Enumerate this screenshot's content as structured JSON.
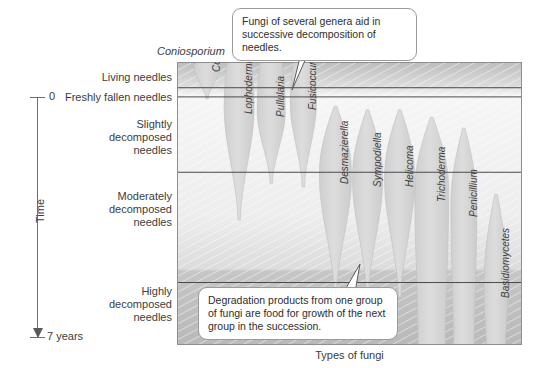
{
  "figure": {
    "x_axis_title": "Types of fungi",
    "time_axis": {
      "label": "Time",
      "start_label": "0",
      "end_label": "7 years"
    },
    "top_specimen_label": "Coniosporium"
  },
  "stages": [
    {
      "id": "living",
      "label": "Living needles"
    },
    {
      "id": "freshly-fallen",
      "label": "Freshly fallen needles"
    },
    {
      "id": "slightly",
      "label": "Slightly\ndecomposed\nneedles"
    },
    {
      "id": "moderately",
      "label": "Moderately\ndecomposed\nneedles"
    },
    {
      "id": "highly",
      "label": "Highly\ndecomposed\nneedles"
    }
  ],
  "callouts": [
    {
      "id": "top",
      "text": "Fungi of several genera aid in successive decomposition of needles."
    },
    {
      "id": "bottom",
      "text": "Degradation products from one group of fungi are food for growth of the next group in the succession."
    }
  ],
  "chart_data": {
    "type": "area",
    "xlabel": "Types of fungi",
    "ylabel": "Time",
    "ylim": [
      0,
      7
    ],
    "ylim_units": "years",
    "grid": false,
    "legend": "none",
    "y_zones": [
      {
        "name": "Living needles",
        "top_years": -0.7,
        "bottom_years": 0.0
      },
      {
        "name": "Freshly fallen needles",
        "top_years": 0.0,
        "bottom_years": 0.25
      },
      {
        "name": "Slightly decomposed needles",
        "top_years": 0.25,
        "bottom_years": 2.3
      },
      {
        "name": "Moderately decomposed needles",
        "top_years": 2.3,
        "bottom_years": 5.3
      },
      {
        "name": "Highly decomposed needles",
        "top_years": 5.3,
        "bottom_years": 7.0
      }
    ],
    "categories": [
      "Coniosporium",
      "Lophodermium",
      "Pullularia",
      "Fusicoccum",
      "Desmazierella",
      "Sympodiella",
      "Helicoma",
      "Trichoderma",
      "Penicillium",
      "Basidiomycetes"
    ],
    "series": [
      {
        "name": "Coniosporium",
        "start_years": -0.7,
        "peak_years": -0.55,
        "end_years": 0.3,
        "max_width": 26
      },
      {
        "name": "Lophodermium",
        "start_years": -0.7,
        "peak_years": 0.6,
        "end_years": 3.6,
        "max_width": 30
      },
      {
        "name": "Pullularia",
        "start_years": -0.7,
        "peak_years": 0.7,
        "end_years": 2.6,
        "max_width": 28
      },
      {
        "name": "Fusicoccum",
        "start_years": -0.7,
        "peak_years": 0.5,
        "end_years": 2.7,
        "max_width": 26
      },
      {
        "name": "Desmazierella",
        "start_years": 0.5,
        "peak_years": 2.5,
        "end_years": 5.6,
        "max_width": 32
      },
      {
        "name": "Sympodiella",
        "start_years": 0.6,
        "peak_years": 2.6,
        "end_years": 5.6,
        "max_width": 30
      },
      {
        "name": "Helicoma",
        "start_years": 0.6,
        "peak_years": 2.6,
        "end_years": 5.7,
        "max_width": 30
      },
      {
        "name": "Trichoderma",
        "start_years": 0.8,
        "peak_years": 3.0,
        "end_years": 7.0,
        "max_width": 34
      },
      {
        "name": "Penicillium",
        "start_years": 1.1,
        "peak_years": 3.4,
        "end_years": 7.0,
        "max_width": 26
      },
      {
        "name": "Basidiomycetes",
        "start_years": 2.9,
        "peak_years": 5.6,
        "end_years": 7.0,
        "max_width": 24
      }
    ]
  },
  "colors": {
    "plot_background_light": "#f4f4f4",
    "plot_background_dark": "#c9c9c9",
    "band_fill": "#d6d6d6",
    "divider": "#4a4a4a",
    "text": "#3c3c3c",
    "callout_border": "#9a9a9a",
    "axis": "#6e6e6e"
  }
}
